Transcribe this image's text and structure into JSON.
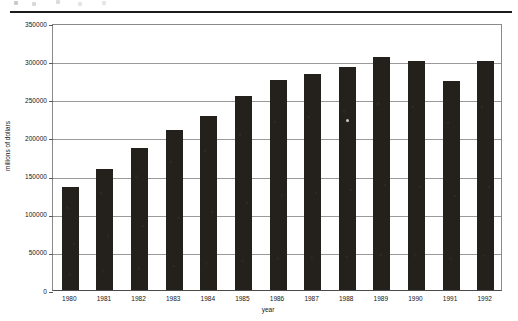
{
  "chart_data": {
    "type": "bar",
    "title": "",
    "xlabel": "year",
    "ylabel": "millions of dollars",
    "categories": [
      "1980",
      "1981",
      "1982",
      "1983",
      "1984",
      "1985",
      "1986",
      "1987",
      "1988",
      "1989",
      "1990",
      "1991",
      "1992"
    ],
    "values": [
      135000,
      158000,
      186000,
      210000,
      228000,
      254000,
      275000,
      283000,
      292000,
      305000,
      300000,
      274000,
      300000
    ],
    "ylim": [
      0,
      350000
    ],
    "ytick_values": [
      0,
      50000,
      100000,
      150000,
      200000,
      250000,
      300000,
      350000
    ],
    "ytick_labels": [
      "0",
      "50000",
      "100000",
      "150000",
      "200000",
      "250000",
      "300000",
      "350000"
    ],
    "xtick_labels": [
      "1980",
      "1981",
      "1982",
      "1983",
      "1984",
      "1985",
      "1986",
      "1987",
      "1988",
      "1989",
      "1990",
      "1991",
      "1992"
    ],
    "grid": true,
    "legend": "none",
    "series_color": "#24201b",
    "gridline_color": "#9a9a9a",
    "axis_color": "#4a4a4a"
  },
  "page": {
    "rule_color": "#1c1c1c"
  }
}
